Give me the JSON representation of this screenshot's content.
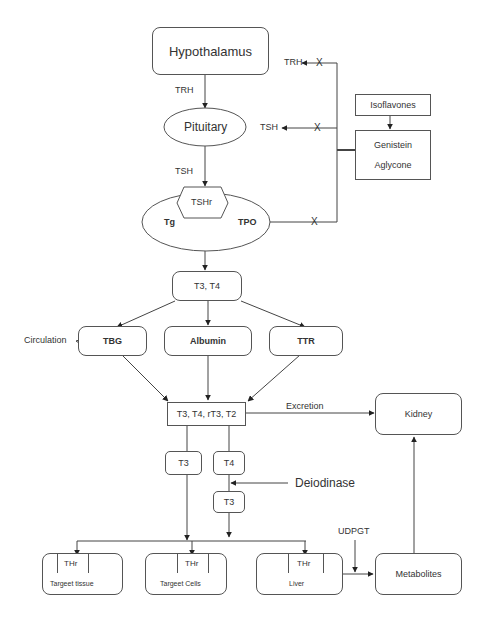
{
  "nodes": {
    "hypothalamus": "Hypothalamus",
    "pituitary": "Pituitary",
    "tshr": "TSHr",
    "tg": "Tg",
    "tpo": "TPO",
    "t3t4": "T3, T4",
    "tbg": "TBG",
    "albumin": "Albumin",
    "ttr": "TTR",
    "t3t4rt3t2": "T3, T4, rT3, T2",
    "t3_left": "T3",
    "t4": "T4",
    "t3_converted": "T3",
    "kidney": "Kidney",
    "isoflavones": "Isoflavones",
    "genistein": "Genistein",
    "aglycone": "Aglycone",
    "target_tissue": "Targeet tissue",
    "target_cells": "Targeet Cells",
    "liver": "Liver",
    "metabolites": "Metabolites",
    "thr": "THr"
  },
  "edge_labels": {
    "trh_down": "TRH",
    "tsh_down": "TSH",
    "trh_inhibit": "TRH",
    "tsh_inhibit": "TSH",
    "inhibit_mark": "X",
    "circulation": "Circulation",
    "excretion": "Excretion",
    "deiodinase": "Deiodinase",
    "udpgt": "UDPGT"
  }
}
